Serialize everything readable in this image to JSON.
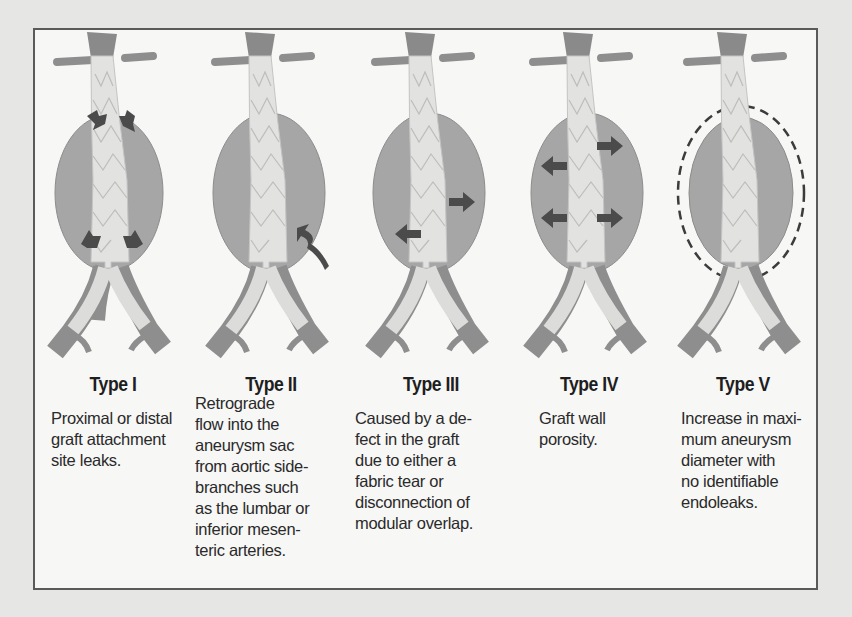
{
  "figure": {
    "colors": {
      "aneurysm_sac": "#a6a6a6",
      "graft": "#e2e2e0",
      "vessel": "#8e8e8e",
      "arrow": "#4b4b4b",
      "frame_border": "#5a5a5a",
      "background": "#e6e6e4",
      "panel_background": "#f7f7f6"
    },
    "panels": [
      {
        "title": "Type I",
        "description": "Proximal or distal\ngraft attachment\nsite leaks.",
        "arrows": "attachment-site arrows at proximal and distal ends"
      },
      {
        "title": "Type II",
        "description": "Retrograde\nflow into the\naneurysm sac\nfrom aortic side-\nbranches such\nas the lumbar or\ninferior mesen-\nteric arteries.",
        "arrows": "wavy retrograde flow arrow from side branch into sac"
      },
      {
        "title": "Type III",
        "description": "Caused by a de-\nfect in the graft\ndue to either a\nfabric tear or\ndisconnection of\nmodular overlap.",
        "arrows": "outward arrows from graft defect"
      },
      {
        "title": "Type IV",
        "description": "Graft wall\nporosity.",
        "arrows": "four outward arrows through graft wall"
      },
      {
        "title": "Type V",
        "description": "Increase in maxi-\nmum aneurysm\ndiameter with\nno identifiable\nendoleaks.",
        "arrows": "dashed outline showing enlarged sac"
      }
    ]
  }
}
